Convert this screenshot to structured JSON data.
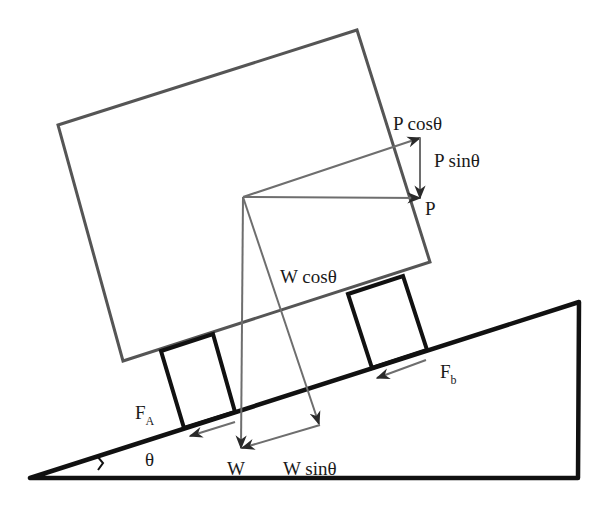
{
  "diagram": {
    "colors": {
      "incline": "#111111",
      "body": "#555555",
      "wheel": "#111111",
      "vector": "#6e6e6e",
      "arrowhead": "#2a2a2a",
      "text": "#1a1a1a"
    },
    "labels": {
      "p_cos": "P cosθ",
      "p_sin": "P sinθ",
      "p": "P",
      "w_cos": "W cosθ",
      "w": "W",
      "w_sin": "W sinθ",
      "fa_main": "F",
      "fa_sub": "A",
      "fb_main": "F",
      "fb_sub": "b",
      "theta": "θ"
    },
    "geometry": {
      "incline": {
        "points": [
          [
            30,
            478
          ],
          [
            578,
            478
          ],
          [
            579,
            302
          ]
        ]
      },
      "body": {
        "points": [
          [
            58,
            125
          ],
          [
            357,
            30
          ],
          [
            430,
            262
          ],
          [
            123,
            361
          ]
        ]
      },
      "wheel_a": {
        "points": [
          [
            161,
            351
          ],
          [
            213,
            334
          ],
          [
            235,
            412
          ],
          [
            184,
            428
          ]
        ]
      },
      "wheel_b": {
        "points": [
          [
            348,
            294
          ],
          [
            403,
            276
          ],
          [
            427,
            350
          ],
          [
            372,
            368
          ]
        ]
      },
      "vectors": [
        {
          "name": "P cosθ",
          "from": [
            243,
            197
          ],
          "to": [
            420,
            138
          ]
        },
        {
          "name": "P sinθ",
          "from": [
            420,
            138
          ],
          "to": [
            420,
            198
          ]
        },
        {
          "name": "P",
          "from": [
            243,
            197
          ],
          "to": [
            420,
            198
          ]
        },
        {
          "name": "W",
          "from": [
            243,
            197
          ],
          "to": [
            241,
            448
          ]
        },
        {
          "name": "W cosθ",
          "from": [
            243,
            197
          ],
          "to": [
            319,
            424
          ]
        },
        {
          "name": "W sinθ",
          "from": [
            320,
            425
          ],
          "to": [
            242,
            448
          ]
        },
        {
          "name": "F_A",
          "from": [
            235,
            422
          ],
          "to": [
            190,
            436
          ]
        },
        {
          "name": "F_b",
          "from": [
            426,
            360
          ],
          "to": [
            377,
            378
          ]
        }
      ]
    }
  }
}
